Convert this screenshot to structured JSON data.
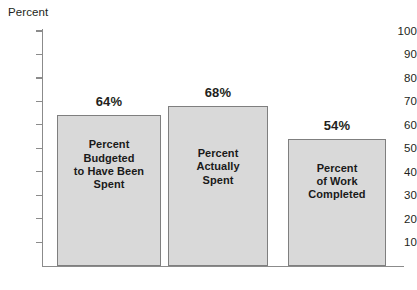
{
  "chart_data": {
    "type": "bar",
    "title": "",
    "subtitle": "",
    "xlabel": "",
    "ylabel": "Percent",
    "ylim": [
      0,
      100
    ],
    "ytick_labels": [
      "100",
      "90",
      "80",
      "70",
      "60",
      "50",
      "40",
      "30",
      "20",
      "10"
    ],
    "yticks": [
      100,
      90,
      80,
      70,
      60,
      50,
      40,
      30,
      20,
      10
    ],
    "grid": false,
    "legend": null,
    "categories": [
      "Percent Budgeted to Have Been Spent",
      "Percent Actually Spent",
      "Percent of Work Completed"
    ],
    "values": [
      64,
      68,
      54
    ],
    "value_labels": [
      "64%",
      "68%",
      "54%"
    ],
    "bar_labels": [
      "Percent\nBudgeted\nto Have Been\nSpent",
      "Percent\nActually\nSpent",
      "Percent\nof Work\nCompleted"
    ],
    "colors": {
      "bar_fill": "#d9d9d9",
      "bar_border": "#7f7f7f",
      "axis": "#8b8b8b",
      "text": "#231f20",
      "background": "#ffffff"
    }
  }
}
